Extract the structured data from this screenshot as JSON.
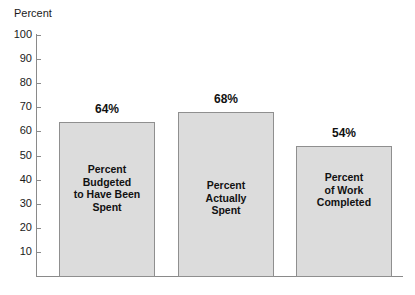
{
  "chart_data": {
    "type": "bar",
    "title": "",
    "xlabel": "",
    "ylabel": "Percent",
    "ylim": [
      0,
      100
    ],
    "ytick_step": 10,
    "yticks": [
      100,
      90,
      80,
      70,
      60,
      50,
      40,
      30,
      20,
      10
    ],
    "grid": false,
    "legend": "none",
    "categories": [
      "Percent Budgeted to Have Been Spent",
      "Percent Actually Spent",
      "Percent of Work Completed"
    ],
    "values": [
      64,
      68,
      54
    ],
    "value_labels": [
      "64%",
      "68%",
      "54%"
    ],
    "bar_labels": [
      "Percent\nBudgeted\nto Have Been\nSpent",
      "Percent\nActually\nSpent",
      "Percent\nof Work\nCompleted"
    ],
    "colors": {
      "bar_fill": "#dcdcdc",
      "bar_border": "#8f8f8f",
      "axis": "#8a8a8a",
      "text": "#1a1a1a",
      "background": "#ffffff"
    }
  }
}
